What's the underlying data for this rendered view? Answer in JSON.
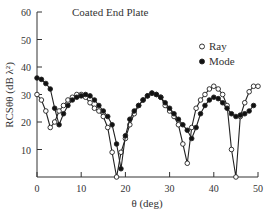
{
  "chart_data": {
    "type": "line",
    "title": "Coated End Plate",
    "xlabel": "θ (deg)",
    "ylabel": "RCSθθ (dB λ²)",
    "xlim": [
      0,
      50
    ],
    "ylim": [
      0,
      60
    ],
    "xticks": [
      0,
      10,
      20,
      30,
      40,
      50
    ],
    "yticks": [
      10,
      20,
      30,
      40,
      50,
      60
    ],
    "grid": false,
    "legend_position": "upper right",
    "series": [
      {
        "name": "Ray",
        "marker": "open-circle",
        "x": [
          0,
          1,
          2,
          3,
          4,
          5,
          6,
          7,
          8,
          9,
          10,
          11,
          12,
          13,
          14,
          15,
          16,
          17,
          18,
          19,
          20,
          21,
          22,
          23,
          24,
          25,
          26,
          27,
          28,
          29,
          30,
          31,
          32,
          33,
          34,
          35,
          36,
          37,
          38,
          39,
          40,
          41,
          42,
          43,
          44,
          45,
          46,
          47,
          48,
          49,
          50
        ],
        "values": [
          30,
          28,
          24,
          18,
          20,
          24,
          26,
          28,
          29,
          30,
          30,
          29,
          27,
          25,
          24,
          22,
          18,
          9,
          0,
          9,
          14,
          19,
          23,
          26,
          28,
          29.5,
          30.5,
          30,
          29,
          26,
          24,
          22,
          19,
          12,
          5,
          18,
          25,
          28,
          30,
          32,
          33,
          32,
          30,
          26,
          10,
          0,
          22,
          27,
          31,
          33,
          33
        ]
      },
      {
        "name": "Mode",
        "marker": "filled-circle",
        "x": [
          0,
          1,
          2,
          3,
          4,
          5,
          6,
          7,
          8,
          9,
          10,
          11,
          12,
          13,
          14,
          15,
          16,
          17,
          18,
          19,
          20,
          21,
          22,
          23,
          24,
          25,
          26,
          27,
          28,
          29,
          30,
          31,
          32,
          33,
          34,
          35,
          36,
          37,
          38,
          39,
          40,
          41,
          42,
          43,
          44,
          45,
          46,
          47,
          48,
          49
        ],
        "values": [
          36,
          35.5,
          34,
          32,
          25,
          19,
          23,
          26,
          28,
          29,
          29.5,
          30,
          29.5,
          28,
          26,
          24,
          22,
          19,
          12,
          3,
          15,
          21,
          24,
          26,
          28,
          29.5,
          30.5,
          30,
          29,
          27,
          25,
          23,
          21,
          19,
          17,
          14,
          18,
          23,
          26,
          28,
          29,
          28.5,
          27,
          25,
          23,
          22,
          22.5,
          23,
          24,
          26
        ]
      }
    ]
  }
}
